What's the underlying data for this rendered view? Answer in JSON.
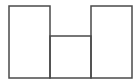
{
  "diagram": {
    "stroke_color": "#4a4a4a",
    "background": "#ffffff",
    "shapes": [
      {
        "name": "left-box",
        "x": 9,
        "y": 6,
        "w": 41,
        "h": 72
      },
      {
        "name": "middle-box",
        "x": 50,
        "y": 36,
        "w": 41,
        "h": 42
      },
      {
        "name": "right-box",
        "x": 91,
        "y": 6,
        "w": 41,
        "h": 72
      }
    ]
  }
}
